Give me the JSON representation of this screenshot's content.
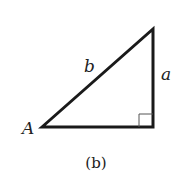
{
  "diagram": {
    "type": "right-triangle",
    "caption": "(b)",
    "vertex_label": "A",
    "hypotenuse_label": "b",
    "opposite_label": "a",
    "right_angle_marker": true,
    "colors": {
      "stroke": "#1a1a1a",
      "marker": "#555555",
      "text": "#222222"
    }
  }
}
